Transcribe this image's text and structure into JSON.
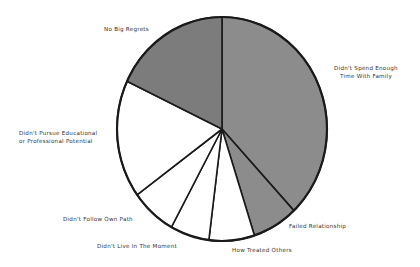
{
  "chart_data": {
    "type": "pie",
    "title": "",
    "start_angle_deg": 0,
    "direction": "clockwise",
    "categories": [
      "Didn't Spend Enough Time With Family",
      "Failed Relationship",
      "How Treated Others",
      "Didn't Live In The Moment",
      "Didn't Follow Own Path",
      "Didn't Pursue Educational or Professional Potential",
      "No Big Regrets"
    ],
    "values": [
      38,
      7,
      7,
      6,
      7,
      17,
      18
    ],
    "colors": [
      "#8c8c8c",
      "#8c8c8c",
      "#ffffff",
      "#ffffff",
      "#ffffff",
      "#ffffff",
      "#7c7c7c"
    ],
    "legend": "none (direct slice labels)"
  },
  "labels": {
    "spend_time_line1": "Didn't Spend Enough",
    "spend_time_line2": "Time With Family",
    "failed_relationship": "Failed Relationship",
    "how_treated": "How Treated Others",
    "live_moment": "Didn't Live In The Moment",
    "follow_path": "Didn't Follow Own Path",
    "pursue_line1": "Didn't Pursue Educational",
    "pursue_line2": "or Professional Potential",
    "no_regrets": "No Big Regrets"
  },
  "style": {
    "outline_color": "#1a1a1a",
    "outline_width": 2
  }
}
